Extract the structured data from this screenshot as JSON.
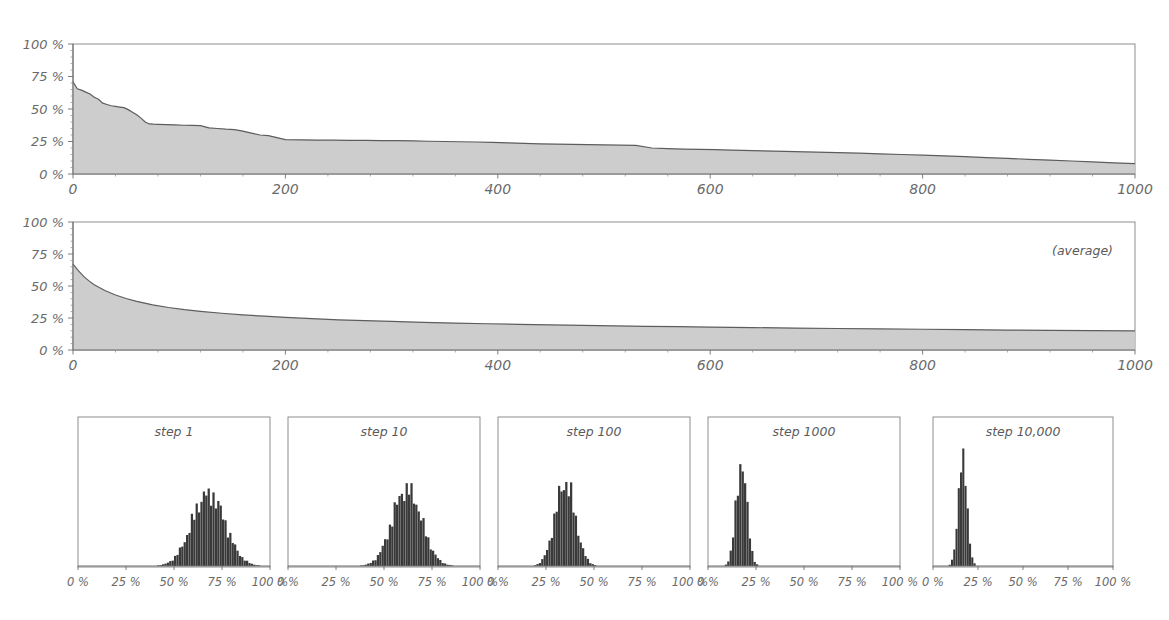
{
  "figure": {
    "background": "#ffffff",
    "area_fill_color": "#c9c9c9",
    "area_line_color": "#5d5d5d",
    "bar_color": "#3a3a3a",
    "axis_color": "#6f6f6f",
    "frame_color": "#8d8d8d"
  },
  "chart_data": [
    {
      "id": "panel-top",
      "type": "area",
      "title": "",
      "xlabel": "",
      "ylabel": "",
      "xlim": [
        0,
        1000
      ],
      "ylim": [
        0,
        100
      ],
      "grid": false,
      "legend": null,
      "xticks": [
        0,
        200,
        400,
        600,
        800,
        1000
      ],
      "xticklabels": [
        "0",
        "200",
        "400",
        "600",
        "800",
        "1000"
      ],
      "yticks": [
        0,
        25,
        50,
        75,
        100
      ],
      "yticklabels": [
        "0 %",
        "25 %",
        "50 %",
        "75 %",
        "100 %"
      ],
      "x": [
        0,
        4,
        8,
        12,
        16,
        20,
        24,
        28,
        32,
        36,
        40,
        44,
        48,
        52,
        56,
        60,
        64,
        68,
        72,
        76,
        80,
        88,
        96,
        104,
        112,
        120,
        128,
        136,
        144,
        152,
        160,
        168,
        176,
        184,
        192,
        200,
        215,
        230,
        245,
        260,
        275,
        290,
        305,
        320,
        335,
        350,
        365,
        380,
        395,
        410,
        425,
        440,
        455,
        470,
        485,
        500,
        515,
        530,
        545,
        560,
        575,
        590,
        605,
        620,
        640,
        660,
        680,
        700,
        720,
        740,
        760,
        780,
        800,
        820,
        840,
        860,
        880,
        900,
        920,
        940,
        960,
        980,
        1000
      ],
      "y": [
        71.0,
        65.5,
        64.5,
        63.0,
        61.5,
        59.0,
        57.5,
        54.5,
        53.5,
        52.5,
        52.0,
        51.5,
        51.0,
        49.5,
        47.5,
        45.5,
        43.0,
        40.0,
        38.5,
        38.3,
        38.2,
        38.0,
        37.8,
        37.5,
        37.4,
        37.2,
        35.5,
        35.0,
        34.5,
        34.2,
        33.0,
        31.5,
        30.0,
        29.5,
        28.0,
        26.5,
        26.3,
        26.1,
        26.0,
        25.9,
        25.8,
        25.7,
        25.6,
        25.5,
        25.2,
        25.0,
        24.8,
        24.6,
        24.4,
        24.0,
        23.6,
        23.2,
        23.0,
        22.8,
        22.6,
        22.4,
        22.2,
        22.0,
        20.0,
        19.5,
        19.2,
        19.0,
        18.7,
        18.4,
        18.0,
        17.6,
        17.2,
        16.9,
        16.5,
        16.0,
        15.5,
        15.0,
        14.5,
        14.0,
        13.3,
        12.6,
        12.0,
        11.3,
        10.7,
        10.0,
        9.3,
        8.6,
        8.0
      ]
    },
    {
      "id": "panel-average",
      "type": "area",
      "title": "",
      "annotation": "(average)",
      "xlabel": "",
      "ylabel": "",
      "xlim": [
        0,
        1000
      ],
      "ylim": [
        0,
        100
      ],
      "grid": false,
      "legend": null,
      "xticks": [
        0,
        200,
        400,
        600,
        800,
        1000
      ],
      "xticklabels": [
        "0",
        "200",
        "400",
        "600",
        "800",
        "1000"
      ],
      "yticks": [
        0,
        25,
        50,
        75,
        100
      ],
      "yticklabels": [
        "0 %",
        "25 %",
        "50 %",
        "75 %",
        "100 %"
      ],
      "x": [
        0,
        5,
        10,
        15,
        20,
        30,
        40,
        50,
        60,
        75,
        90,
        105,
        120,
        140,
        160,
        180,
        200,
        225,
        250,
        275,
        300,
        330,
        360,
        390,
        420,
        450,
        480,
        510,
        540,
        570,
        600,
        640,
        680,
        720,
        760,
        800,
        840,
        880,
        920,
        960,
        1000
      ],
      "y": [
        67.0,
        62.0,
        57.5,
        54.0,
        51.0,
        46.5,
        43.0,
        40.2,
        38.0,
        35.3,
        33.2,
        31.5,
        30.2,
        28.7,
        27.4,
        26.4,
        25.5,
        24.5,
        23.6,
        22.9,
        22.3,
        21.6,
        21.0,
        20.5,
        20.0,
        19.6,
        19.2,
        18.8,
        18.5,
        18.2,
        17.9,
        17.5,
        17.1,
        16.8,
        16.5,
        16.2,
        15.9,
        15.6,
        15.4,
        15.1,
        14.9
      ]
    },
    {
      "id": "hist-step-1",
      "type": "bar",
      "title": "step 1",
      "xlabel": "",
      "ylabel": "",
      "xlim": [
        0,
        100
      ],
      "ylim": [
        0,
        100
      ],
      "grid": false,
      "legend": null,
      "xticks": [
        0,
        25,
        50,
        75,
        100
      ],
      "xticklabels": [
        "0 %",
        "25 %",
        "50 %",
        "75 %",
        "100 %"
      ],
      "mean_pct": 68,
      "std_pct": 8.5,
      "peak_height_pct": 58,
      "bin_width_pct": 1.25
    },
    {
      "id": "hist-step-10",
      "type": "bar",
      "title": "step 10",
      "xlabel": "",
      "ylabel": "",
      "xlim": [
        0,
        100
      ],
      "ylim": [
        0,
        100
      ],
      "grid": false,
      "legend": null,
      "xticks": [
        0,
        25,
        50,
        75,
        100
      ],
      "xticklabels": [
        "0 %",
        "25 %",
        "50 %",
        "75 %",
        "100 %"
      ],
      "mean_pct": 62,
      "std_pct": 7.5,
      "peak_height_pct": 62,
      "bin_width_pct": 1.25
    },
    {
      "id": "hist-step-100",
      "type": "bar",
      "title": "step 100",
      "xlabel": "",
      "ylabel": "",
      "xlim": [
        0,
        100
      ],
      "ylim": [
        0,
        100
      ],
      "grid": false,
      "legend": null,
      "xticks": [
        0,
        25,
        50,
        75,
        100
      ],
      "xticklabels": [
        "0 %",
        "25 %",
        "50 %",
        "75 %",
        "100 %"
      ],
      "mean_pct": 35,
      "std_pct": 5.2,
      "peak_height_pct": 66,
      "bin_width_pct": 1.25
    },
    {
      "id": "hist-step-1000",
      "type": "bar",
      "title": "step 1000",
      "xlabel": "",
      "ylabel": "",
      "xlim": [
        0,
        100
      ],
      "ylim": [
        0,
        100
      ],
      "grid": false,
      "legend": null,
      "xticks": [
        0,
        25,
        50,
        75,
        100
      ],
      "xticklabels": [
        "0 %",
        "25 %",
        "50 %",
        "75 %",
        "100 %"
      ],
      "mean_pct": 17.5,
      "std_pct": 2.8,
      "peak_height_pct": 82,
      "bin_width_pct": 1.25
    },
    {
      "id": "hist-step-10000",
      "type": "bar",
      "title": "step 10,000",
      "xlabel": "",
      "ylabel": "",
      "xlim": [
        0,
        100
      ],
      "ylim": [
        0,
        100
      ],
      "grid": false,
      "legend": null,
      "xticks": [
        0,
        25,
        50,
        75,
        100
      ],
      "xticklabels": [
        "0 %",
        "25 %",
        "50 %",
        "75 %",
        "100 %"
      ],
      "mean_pct": 16.5,
      "std_pct": 2.4,
      "peak_height_pct": 88,
      "bin_width_pct": 1.25
    }
  ]
}
